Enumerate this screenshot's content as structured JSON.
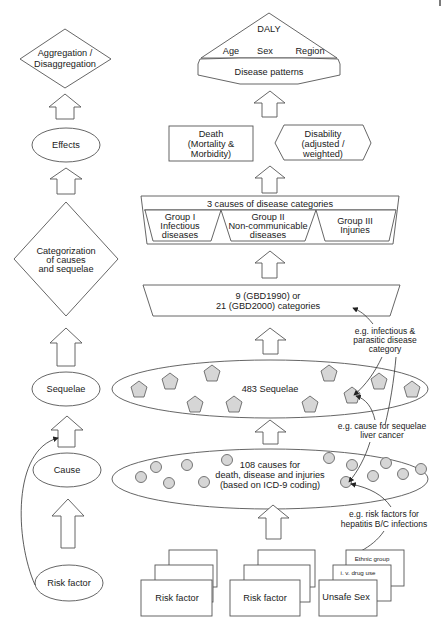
{
  "left_column": {
    "aggregation": [
      "Aggregation /",
      "Disaggregation"
    ],
    "effects": "Effects",
    "categorization": [
      "Categorization",
      "of causes",
      "and sequelae"
    ],
    "sequelae": "Sequelae",
    "cause": "Cause",
    "risk_factor": "Risk factor"
  },
  "top": {
    "daly": "DALY",
    "dimensions": [
      "Age",
      "Sex",
      "Region"
    ],
    "disease_patterns": "Disease patterns"
  },
  "outcomes": {
    "death": [
      "Death",
      "(Mortality &",
      "Morbidity)"
    ],
    "disability": [
      "Disability",
      "(adjusted /",
      "weighted)"
    ]
  },
  "categories": {
    "title": "3 causes of disease categories",
    "groups": [
      [
        "Group I",
        "Infectious",
        "diseases"
      ],
      [
        "Group II",
        "Non-communicable",
        "diseases"
      ],
      [
        "Group III",
        "Injuries"
      ]
    ]
  },
  "gbd": [
    "9 (GBD1990) or",
    "21 (GBD2000) categories"
  ],
  "sequelae_set": {
    "label": "483 Sequelae",
    "pentagon_count": 11
  },
  "causes_set": {
    "label": [
      "108 causes for",
      "death, disease and injuries",
      "(based on ICD-9 coding)"
    ],
    "circle_count": 15
  },
  "annotations": {
    "infectious": [
      "e.g. infectious &",
      "parasitic disease",
      "category"
    ],
    "liver": [
      "e.g. cause for sequelae",
      "liver cancer"
    ],
    "hepatitis": [
      "e.g. risk factors for",
      "hepatitis B/C infections"
    ]
  },
  "risk_factor_stacks": [
    {
      "front": "Risk factor",
      "middle": "",
      "back": ""
    },
    {
      "front": "Risk factor",
      "middle": "",
      "back": ""
    },
    {
      "front": "Unsafe Sex",
      "middle": "i. v. drug use",
      "back": "Ethnic group"
    }
  ]
}
